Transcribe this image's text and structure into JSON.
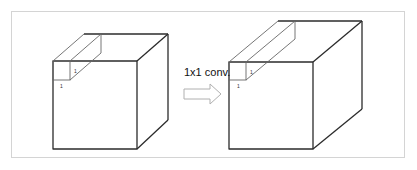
{
  "diagram": {
    "operation_label": "1x1 conv.",
    "input_volume": {
      "kernel_width_label": "1",
      "kernel_height_label": "1"
    },
    "output_volume": {
      "kernel_width_label": "1",
      "kernel_height_label": "1"
    },
    "arrow": "hollow-right-arrow",
    "colors": {
      "edge": "#2b2b2b",
      "thin_edge": "#666666",
      "arrow": "#b0b0b0",
      "frame": "#d4d4d4"
    }
  }
}
